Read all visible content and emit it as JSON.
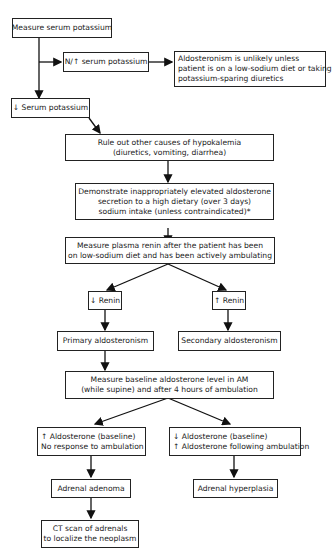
{
  "nodes": {
    "measure_k": {
      "lines": [
        "Measure serum potassium"
      ]
    },
    "normal_k": {
      "lines": [
        "N/↑ serum potassium"
      ]
    },
    "unlikely": {
      "lines": [
        "Aldosteronism is unlikely unless",
        "patient is on a low-sodium diet or taking",
        "potassium-sparing diuretics"
      ]
    },
    "low_k": {
      "lines": [
        "↓ Serum potassium"
      ]
    },
    "rule_out": {
      "lines": [
        "Rule out other causes of hypokalemia",
        "(diuretics, vomiting, diarrhea)"
      ]
    },
    "demonstrate": {
      "lines": [
        "Demonstrate inappropriately elevated aldosterone",
        "secretion to a high dietary (over 3 days)",
        "sodium intake (unless contraindicated)*"
      ]
    },
    "renin": {
      "lines": [
        "Measure plasma renin after the patient has been",
        "on low-sodium diet and has been actively ambulating"
      ]
    },
    "low_renin": {
      "lines": [
        "↓ Renin"
      ]
    },
    "high_renin": {
      "lines": [
        "↑ Renin"
      ]
    },
    "primary": {
      "lines": [
        "Primary aldosteronism"
      ]
    },
    "secondary": {
      "lines": [
        "Secondary aldosteronism"
      ]
    },
    "baseline": {
      "lines": [
        "Measure baseline aldosterone level in AM",
        "(while supine) and after 4 hours of ambulation"
      ]
    },
    "high_aldo": {
      "lines": [
        "↑ Aldosterone (baseline)",
        "No response to ambulation"
      ]
    },
    "low_aldo": {
      "lines": [
        "↓ Aldosterone (baseline)",
        "↑ Aldosterone following ambulation"
      ]
    },
    "adenoma": {
      "lines": [
        "Adrenal adenoma"
      ]
    },
    "hyperplasia": {
      "lines": [
        "Adrenal hyperplasia"
      ]
    },
    "ct": {
      "lines": [
        "CT scan of adrenals",
        "to localize the neoplasm"
      ]
    }
  }
}
